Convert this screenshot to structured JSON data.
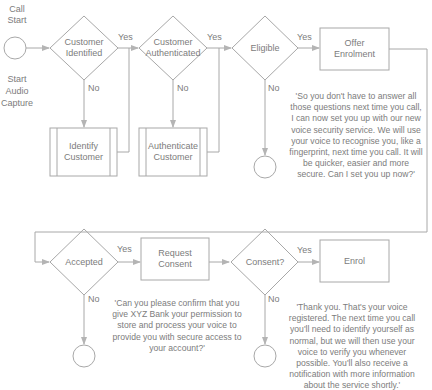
{
  "start": {
    "top_label": "Call\nStart",
    "bottom_label": "Start\nAudio\nCapture"
  },
  "row1": {
    "decision_identified": "Customer\nIdentified",
    "decision_authenticated": "Customer\nAuthenticated",
    "decision_eligible": "Eligible",
    "process_offer": "Offer\nEnrolment",
    "process_identify": "Identify\nCustomer",
    "process_authenticate": "Authenticate\nCustomer",
    "offer_script": "'So you don't have to answer all those questions next time you call, I can now set you up with our new voice security service. We will use your voice to recognise you, like a fingerprint, next time you call. It will be quicker, easier and more secure. Can I set you up now?'"
  },
  "row2": {
    "decision_accepted": "Accepted",
    "process_request_consent": "Request\nConsent",
    "decision_consent": "Consent?",
    "process_enrol": "Enrol",
    "consent_script": "'Can you please confirm that you give XYZ Bank your permission to store and process your voice to provide you with secure access to your account?'",
    "enrol_script": "'Thank you. That's your voice registered. The next time you call you'll need to identify yourself as normal, but we will then use your voice to verify you whenever possible. You'll also receive a notification with more information about the service shortly.'"
  },
  "edge_labels": {
    "yes": "Yes",
    "no": "No"
  },
  "colors": {
    "stroke": "#a8a8a8",
    "arrow": "#b0b0b0",
    "text": "#7c7c7c"
  }
}
